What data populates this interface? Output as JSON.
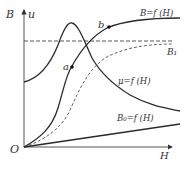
{
  "diagram": {
    "type": "magnetization-curves",
    "axes": {
      "y_label_B": "B",
      "y_label_mu": "u",
      "x_label": "H",
      "origin_label": "O"
    },
    "curves": [
      {
        "id": "B",
        "label": "B=f (H)",
        "style": "solid"
      },
      {
        "id": "mu",
        "label": "μ=f (H)",
        "style": "solid"
      },
      {
        "id": "B0",
        "label": "B₀=f (H)",
        "style": "solid"
      },
      {
        "id": "B1",
        "label": "B₁",
        "style": "dashed"
      },
      {
        "id": "B-dashed",
        "label": "",
        "style": "dashed"
      }
    ],
    "points": [
      {
        "label": "a"
      },
      {
        "label": "b"
      }
    ],
    "colors": {
      "line": "#2a2a2a",
      "dashed": "#555555",
      "text": "#333333"
    }
  }
}
